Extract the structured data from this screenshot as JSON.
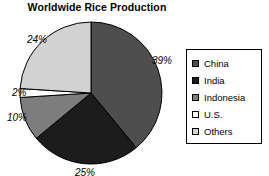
{
  "chart_data": {
    "type": "pie",
    "title": "Worldwide Rice Production",
    "xlabel": "",
    "ylabel": "",
    "grid": false,
    "legend_position": "right",
    "start_angle_deg": 0,
    "direction": "clockwise",
    "categories": [
      "China",
      "India",
      "Indonesia",
      "U.S.",
      "Others"
    ],
    "values": [
      39,
      25,
      10,
      2,
      24
    ],
    "value_unit": "%",
    "data_labels": [
      "39%",
      "25%",
      "10%",
      "2%",
      "24%"
    ],
    "slice_colors": [
      "#4e4e4e",
      "#1c1c1c",
      "#7d7d7d",
      "#ffffff",
      "#d2d2d2"
    ],
    "slice_outline_color": "#000000",
    "series": [
      {
        "name": "Share of worldwide rice production",
        "points": [
          {
            "label": "China",
            "value": 39,
            "data_label": "39%",
            "color": "#4e4e4e"
          },
          {
            "label": "India",
            "value": 25,
            "data_label": "25%",
            "color": "#1c1c1c"
          },
          {
            "label": "Indonesia",
            "value": 10,
            "data_label": "10%",
            "color": "#7d7d7d"
          },
          {
            "label": "U.S.",
            "value": 2,
            "data_label": "2%",
            "color": "#ffffff"
          },
          {
            "label": "Others",
            "value": 24,
            "data_label": "24%",
            "color": "#d2d2d2"
          }
        ]
      }
    ]
  },
  "title": {
    "text": "Worldwide Rice Production"
  },
  "labels": {
    "china": "39%",
    "india": "25%",
    "indonesia": "10%",
    "us": "2%",
    "others": "24%"
  },
  "legend": {
    "items": [
      {
        "label": "China",
        "color": "#4e4e4e"
      },
      {
        "label": "India",
        "color": "#1c1c1c"
      },
      {
        "label": "Indonesia",
        "color": "#7d7d7d"
      },
      {
        "label": "U.S.",
        "color": "#ffffff"
      },
      {
        "label": "Others",
        "color": "#d2d2d2"
      }
    ]
  },
  "colors": {
    "background": "#ffffff",
    "foreground": "#000000",
    "legend_border": "#000000"
  }
}
